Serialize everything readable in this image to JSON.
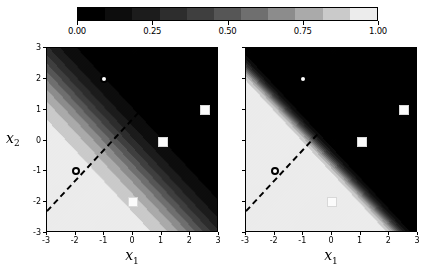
{
  "figure": {
    "width": 447,
    "height": 275,
    "background": "#ffffff"
  },
  "colorbar": {
    "name": "probability-colorbar",
    "orientation": "horizontal",
    "vmin": 0.0,
    "vmax": 1.0,
    "cmap": "gray",
    "ticks": [
      0.0,
      0.25,
      0.5,
      0.75,
      1.0
    ],
    "tick_labels": [
      "0.00",
      "0.25",
      "0.50",
      "0.75",
      "1.00"
    ],
    "levels": [
      0.0,
      0.1,
      0.2,
      0.3,
      0.4,
      0.5,
      0.6,
      0.7,
      0.8,
      0.9,
      1.0
    ],
    "level_colors": [
      "#000000",
      "#0d0d0d",
      "#1c1c1c",
      "#2d2d2d",
      "#3f3f3f",
      "#565656",
      "#6f6f6f",
      "#8c8c8c",
      "#aaaaaa",
      "#cacaca",
      "#ececec"
    ]
  },
  "panels": [
    {
      "id": "left",
      "name": "panel-left",
      "xlabel": "x1",
      "ylabel": "x2",
      "xlim": [
        -3,
        3
      ],
      "ylim": [
        -3,
        3
      ],
      "xticks": [
        -3,
        -2,
        -1,
        0,
        1,
        2,
        3
      ],
      "xtick_labels": [
        "-3",
        "-2",
        "-1",
        "0",
        "1",
        "2",
        "3"
      ],
      "yticks": [
        -3,
        -2,
        -1,
        0,
        1,
        2,
        3
      ],
      "ytick_labels": [
        "-3",
        "-2",
        "-1",
        "0",
        "1",
        "2",
        "3"
      ],
      "show_ytick_labels": true,
      "decision_boundary": {
        "from": [
          -3.0,
          -2.35
        ],
        "to": [
          2.35,
          3.0
        ],
        "style": "dashed",
        "color": "#000000",
        "level": 0.5
      },
      "steepness": 1.35
    },
    {
      "id": "right",
      "name": "panel-right",
      "xlabel": "x1",
      "ylabel": "x2",
      "xlim": [
        -3,
        3
      ],
      "ylim": [
        -3,
        3
      ],
      "xticks": [
        -3,
        -2,
        -1,
        0,
        1,
        2,
        3
      ],
      "xtick_labels": [
        "-3",
        "-2",
        "-1",
        "0",
        "1",
        "2",
        "3"
      ],
      "yticks": [
        -3,
        -2,
        -1,
        0,
        1,
        2,
        3
      ],
      "ytick_labels": [
        "",
        "",
        "",
        "",
        "",
        "",
        ""
      ],
      "show_ytick_labels": false,
      "decision_boundary": {
        "from": [
          -3.0,
          -2.35
        ],
        "to": [
          2.35,
          3.0
        ],
        "style": "dashed",
        "color": "#000000",
        "level": 0.5
      },
      "steepness": 5.5
    }
  ],
  "chart_data": {
    "type": "heatmap",
    "title": "",
    "xlabel": "x1",
    "ylabel": "x2",
    "xlim": [
      -3,
      3
    ],
    "ylim": [
      -3,
      3
    ],
    "grid": false,
    "legend": "none",
    "colorbar_label": "",
    "colorbar_range": [
      0.0,
      1.0
    ],
    "colorbar_ticks": [
      0.0,
      0.25,
      0.5,
      0.75,
      1.0
    ],
    "panels": [
      {
        "name": "left",
        "field": "p = sigmoid(-1.35*(x1 + x2 + 0.65))",
        "contour_levels": [
          0.0,
          0.1,
          0.2,
          0.3,
          0.4,
          0.5,
          0.6,
          0.7,
          0.8,
          0.9,
          1.0
        ],
        "decision_boundary_equation": "x1 + x2 + 0.65 = 0"
      },
      {
        "name": "right",
        "field": "p = sigmoid(-5.5*(x1 + x2 + 0.65))",
        "contour_levels": [
          0.0,
          0.1,
          0.2,
          0.3,
          0.4,
          0.5,
          0.6,
          0.7,
          0.8,
          0.9,
          1.0
        ],
        "decision_boundary_equation": "x1 + x2 + 0.65 = 0"
      }
    ],
    "series": [
      {
        "name": "class-0-circles",
        "marker": "circle",
        "facecolor": "#ffffff",
        "edgecolor": "#000000",
        "points": [
          {
            "x": -1.0,
            "y": 2.0
          },
          {
            "x": -2.0,
            "y": -1.0
          }
        ]
      },
      {
        "name": "class-1-squares",
        "marker": "square",
        "facecolor": "#fbfbfb",
        "edgecolor": "#dddddd",
        "points": [
          {
            "x": 2.5,
            "y": 1.0
          },
          {
            "x": 1.05,
            "y": -0.05
          },
          {
            "x": 0.0,
            "y": -2.0
          }
        ]
      }
    ]
  }
}
